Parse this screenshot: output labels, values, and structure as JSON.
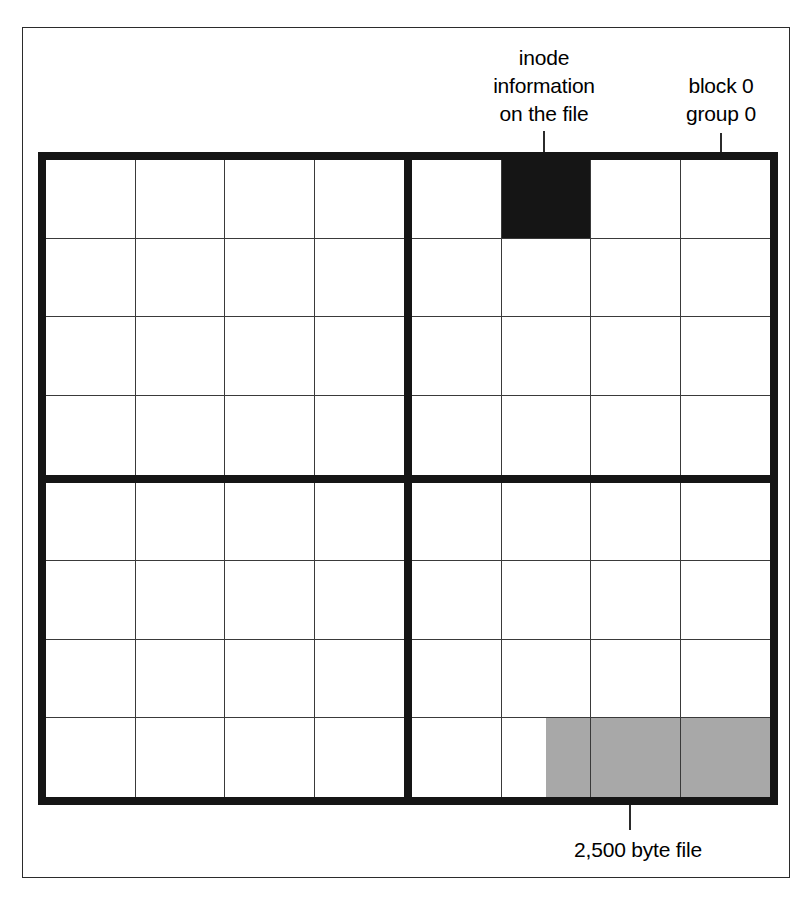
{
  "figure": {
    "colors": {
      "frame": "#2b2b2b",
      "grid_thick": "#151515",
      "grid_thin": "#3a3a3a",
      "inode_block": "#151515",
      "file_data_block": "#a8a8a8",
      "background": "#ffffff"
    }
  },
  "labels": {
    "inode": "inode\ninformation\non the file",
    "block_group": "block 0\ngroup 0",
    "file": "2,500 byte file"
  },
  "grid": {
    "columns": 8,
    "rows": 8,
    "quadrant_columns": 4,
    "quadrant_rows": 4,
    "quadrants": 4,
    "quadrant_order": [
      "top-left",
      "top-right",
      "bottom-left",
      "bottom-right"
    ],
    "marked_cells": [
      {
        "quadrant": "top-right",
        "row": 0,
        "col": 1,
        "fill": "black",
        "meaning": "inode information on the file"
      },
      {
        "quadrant": "bottom-right",
        "row": 3,
        "col": 1,
        "fill": "half-right",
        "meaning": "2,500 byte file data"
      },
      {
        "quadrant": "bottom-right",
        "row": 3,
        "col": 2,
        "fill": "gray",
        "meaning": "2,500 byte file data"
      },
      {
        "quadrant": "bottom-right",
        "row": 3,
        "col": 3,
        "fill": "gray",
        "meaning": "2,500 byte file data"
      }
    ]
  }
}
